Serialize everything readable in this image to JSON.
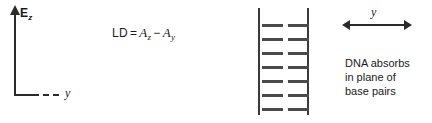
{
  "figure": {
    "background_color": "#ffffff",
    "ink_color": "#2b2b2b"
  },
  "axes": {
    "vertical_label_symbol": "E",
    "vertical_label_subscript": "z",
    "horizontal_label": "y",
    "vertical_axis_name": "electric-field-z-axis",
    "horizontal_axis_name": "y-axis-dashed"
  },
  "equation": {
    "lhs": "LD",
    "equals": "=",
    "term1_symbol": "A",
    "term1_subscript": "z",
    "operator": "−",
    "term2_symbol": "A",
    "term2_subscript": "y",
    "full_text": "LD = Az − Ay"
  },
  "ladder": {
    "description": "DNA base-pair stack schematic",
    "rail_count": 2,
    "rung_count": 7,
    "rung_positions_y": [
      24,
      38,
      52,
      66,
      80,
      94,
      108
    ],
    "rung_color": "#4a4a4a",
    "rail_color": "#3a3a3a"
  },
  "arrow": {
    "label": "y",
    "style": "double-headed-horizontal"
  },
  "caption": {
    "line1": "DNA absorbs",
    "line2": "in plane of",
    "line3": "base pairs"
  }
}
